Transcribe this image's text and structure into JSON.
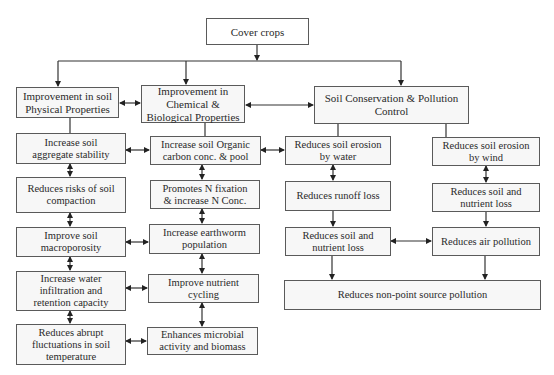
{
  "root": {
    "label": "Cover crops"
  },
  "categories": [
    {
      "label": "Improvement in soil\nPhysical Properties",
      "items": [
        "Increase soil\naggregate stability",
        "Reduces risks of soil\ncompaction",
        "Improve soil\nmacroporosity",
        "Increase water\ninfiltration and\nretention capacity",
        "Reduces abrupt\nfluctuations in soil\ntemperature"
      ]
    },
    {
      "label": "Improvement in\nChemical &\nBiological Properties",
      "items": [
        "Increase soil Organic\ncarbon conc. & pool",
        "Promotes N fixation\n& increase N Conc.",
        "Increase earthworm\npopulation",
        "Improve nutrient\ncycling",
        "Enhances microbial\nactivity and biomass"
      ]
    },
    {
      "label": "Soil Conservation & Pollution\nControl",
      "water_branch": [
        "Reduces soil erosion\nby water",
        "Reduces runoff loss",
        "Reduces soil and\nnutrient loss"
      ],
      "wind_branch": [
        "Reduces soil erosion\nby wind",
        "Reduces soil and\nnutrient loss",
        "Reduces air pollution"
      ],
      "outcome": "Reduces non-point source pollution"
    }
  ],
  "colors": {
    "border": "#5a5a5a",
    "box_fill": "#f7f7f7",
    "line": "#333333",
    "text": "#2a2a2a"
  }
}
